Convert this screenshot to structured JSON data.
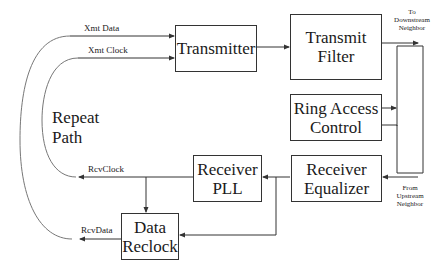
{
  "diagram": {
    "blocks": {
      "transmitter": "Transmitter",
      "transmit_filter_1": "Transmit",
      "transmit_filter_2": "Filter",
      "ring_access_1": "Ring Access",
      "ring_access_2": "Control",
      "receiver_equalizer_1": "Receiver",
      "receiver_equalizer_2": "Equalizer",
      "receiver_pll_1": "Receiver",
      "receiver_pll_2": "PLL",
      "data_reclock_1": "Data",
      "data_reclock_2": "Reclock"
    },
    "signals": {
      "xmt_data": "Xmt Data",
      "xmt_clock": "Xmt Clock",
      "rcv_clock": "RcvClock",
      "rcv_data": "RcvData"
    },
    "annotations": {
      "repeat_path_1": "Repeat",
      "repeat_path_2": "Path",
      "to_downstream_1": "To",
      "to_downstream_2": "Downstream",
      "to_downstream_3": "Neighbor",
      "from_upstream_1": "From",
      "from_upstream_2": "Upstream",
      "from_upstream_3": "Neighbor"
    },
    "colors": {
      "line": "#333333",
      "background": "#ffffff"
    }
  }
}
